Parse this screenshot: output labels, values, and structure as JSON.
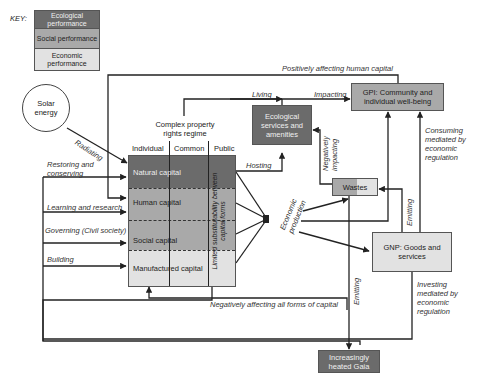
{
  "key": {
    "label": "KEY:",
    "items": [
      {
        "label": "Ecological performance",
        "color": "#6b6b6b"
      },
      {
        "label": "Social performance",
        "color": "#a9a9a9"
      },
      {
        "label": "Economic performance",
        "color": "#e2e2e2"
      }
    ]
  },
  "nodes": {
    "solar": "Solar energy",
    "property_regime": "Complex property rights regime",
    "columns": [
      "Individual",
      "Common",
      "Public"
    ],
    "capitals": [
      "Natural capital",
      "Human capital",
      "Social capital",
      "Manufactured capital"
    ],
    "substitutability": "Limited substitutability between capital forms",
    "eco_services": "Ecological services and amenities",
    "gpi": "GPI: Community and individual well-being",
    "wastes": "Wastes",
    "gnp": "GNP: Goods and services",
    "gaia": "Increasingly heated Gaia"
  },
  "edges": {
    "positively_affecting": "Positively affecting human capital",
    "living": "Living",
    "impacting": "Impacting",
    "radiating": "Radiating",
    "restoring": "Restoring and conserving",
    "learning": "Learning and research",
    "governing": "Governing (Civil society)",
    "building": "Building",
    "hosting": "Hosting",
    "neg_impacting": "Negatively impacting",
    "economic_production": "Economic production",
    "emitting1": "Emitting",
    "emitting2": "Emitting",
    "consuming": "Consuming mediated by economic regulation",
    "investing": "Investing mediated by economic regulation",
    "negatively_affecting": "Negatively affecting all forms of capital"
  }
}
